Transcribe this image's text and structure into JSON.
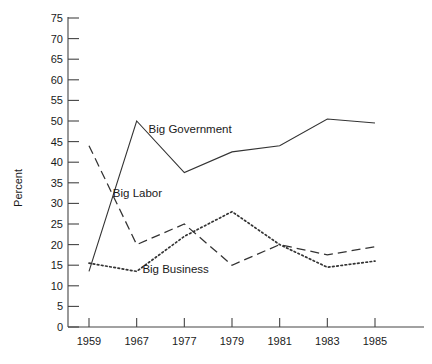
{
  "chart_data": {
    "type": "line",
    "title": "",
    "xlabel": "",
    "ylabel": "Percent",
    "categories": [
      "1959",
      "1967",
      "1977",
      "1979",
      "1981",
      "1983",
      "1985"
    ],
    "x": [
      1959,
      1967,
      1977,
      1979,
      1981,
      1983,
      1985
    ],
    "ylim": [
      0,
      75
    ],
    "yticks": [
      0,
      5,
      10,
      15,
      20,
      25,
      30,
      35,
      40,
      45,
      50,
      55,
      60,
      65,
      70,
      75
    ],
    "ytick_labels": [
      "0",
      "5",
      "10",
      "15",
      "20",
      "25",
      "30",
      "35",
      "40",
      "45",
      "50",
      "55",
      "60",
      "65",
      "70",
      "75"
    ],
    "grid": false,
    "legend_position": "inline-annotations",
    "series": [
      {
        "name": "Big Government",
        "style": "solid",
        "color": "#333333",
        "values": [
          13.5,
          50,
          37.5,
          42.5,
          44,
          50.5,
          49.5
        ],
        "label_x": 1969.5,
        "label_y": 47
      },
      {
        "name": "Big Labor",
        "style": "dashed",
        "color": "#333333",
        "values": [
          44,
          20,
          25,
          15,
          20,
          17.5,
          19.5
        ],
        "label_x": 1963.0,
        "label_y": 31.5
      },
      {
        "name": "Big Business",
        "style": "dotted",
        "color": "#333333",
        "values": [
          15.5,
          13.5,
          22,
          28,
          20,
          14.5,
          16
        ],
        "label_x": 1968.2,
        "label_y": 13.0
      }
    ]
  },
  "axes": {
    "y_axis_title": "Percent"
  }
}
